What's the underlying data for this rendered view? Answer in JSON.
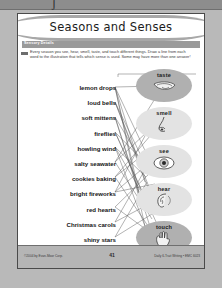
{
  "window": {
    "top_bar_glyph": "ʃ"
  },
  "worksheet": {
    "title": "Seasons and Senses",
    "section_label": "Sensory Details",
    "instructions": "Every season you see, hear, smell, taste, and touch different things. Draw a line from each word to the illustration that tells which sense is used. Some may have more than one answer!",
    "words": [
      {
        "text": "lemon drops"
      },
      {
        "text": "loud bells"
      },
      {
        "text": "soft mittens"
      },
      {
        "text": "fireflies"
      },
      {
        "text": "howling wind"
      },
      {
        "text": "salty seawater"
      },
      {
        "text": "cookies baking"
      },
      {
        "text": "bright fireworks"
      },
      {
        "text": "red hearts"
      },
      {
        "text": "Christmas carols"
      },
      {
        "text": "shiny stars"
      }
    ],
    "senses": [
      {
        "label": "taste",
        "icon": "tongue-icon",
        "shade": "dark"
      },
      {
        "label": "smell",
        "icon": "nose-icon",
        "shade": "light"
      },
      {
        "label": "see",
        "icon": "eye-icon",
        "shade": "light"
      },
      {
        "label": "hear",
        "icon": "ear-icon",
        "shade": "light"
      },
      {
        "label": "touch",
        "icon": "hand-icon",
        "shade": "dark"
      }
    ],
    "footer": {
      "left": "©2004 by Evan-Moor Corp.",
      "page_number": "41",
      "right": "Daily 6-Trait Writing • EMC 6023"
    }
  },
  "colors": {
    "page_background": "#ffffff",
    "outer_background": "#b9b9b9",
    "banner": "#a8a8a8",
    "strip": "#9a9a9a",
    "oval_dark": "#b0b0b0",
    "oval_light": "#e3e3e3",
    "footer": "#b5b5b5",
    "line": "#555555"
  }
}
